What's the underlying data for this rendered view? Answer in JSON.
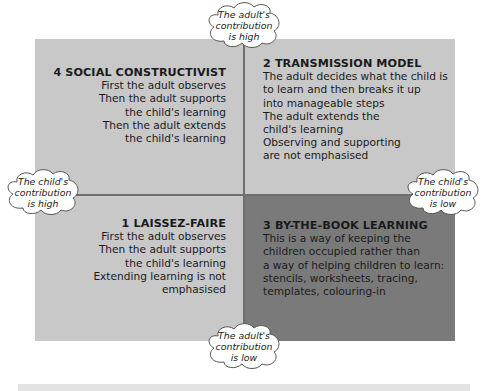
{
  "diagram": {
    "quadrants": {
      "top_left": {
        "number": "4",
        "title": "4  SOCIAL CONSTRUCTIVIST",
        "lines": [
          "First the adult observes",
          "Then the adult supports",
          "the child's learning",
          "Then the adult extends",
          "the child's learning"
        ],
        "fill": "#c8c8c8"
      },
      "top_right": {
        "number": "2",
        "title": "2  TRANSMISSION MODEL",
        "lines": [
          "The adult decides what the child is",
          "to learn and then breaks it up",
          "into manageable steps",
          "The adult extends the",
          "child's learning",
          "Observing and supporting",
          "are not emphasised"
        ],
        "fill": "#c8c8c8"
      },
      "bottom_left": {
        "number": "1",
        "title": "1  LAISSEZ-FAIRE",
        "lines": [
          "First the adult observes",
          "Then the adult supports",
          "the child's learning",
          "Extending learning is not",
          "emphasised"
        ],
        "fill": "#c8c8c8"
      },
      "bottom_right": {
        "number": "3",
        "title": "3  BY-THE-BOOK LEARNING",
        "lines": [
          "This is a way of keeping the",
          "children occupied rather than",
          "a way of helping children to learn:",
          "stencils, worksheets, tracing,",
          "templates, colouring-in"
        ],
        "fill": "#7a7a7a"
      }
    },
    "axis_labels": {
      "top": [
        "The adult's",
        "contribution",
        "is high"
      ],
      "bottom": [
        "The adult's",
        "contribution",
        "is low"
      ],
      "left": [
        "The child's",
        "contribution",
        "is high"
      ],
      "right": [
        "The child's",
        "contribution",
        "is low"
      ]
    },
    "colors": {
      "light_quadrant": "#c8c8c8",
      "dark_quadrant": "#7a7a7a",
      "divider": "#6e6e6e",
      "cloud_fill": "#ffffff",
      "cloud_stroke": "#555555"
    }
  }
}
